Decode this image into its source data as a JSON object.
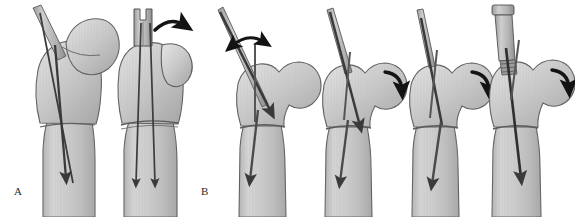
{
  "figure": {
    "kind": "surgical-technique-illustration",
    "background_color": "#ffffff",
    "width": 575,
    "height": 217,
    "palette": {
      "bone_fill": "#c6c6c6",
      "bone_fill_light": "#d8d8d8",
      "bone_fill_dark": "#a8a8a8",
      "bone_outline": "#5d5d5d",
      "instrument_fill": "#b4b4b4",
      "instrument_outline": "#555555",
      "arrow_dark": "#3a3a3a",
      "arrow_black": "#1a1a1a",
      "guidewire": "#454545",
      "label_color": "#2b2b2b"
    }
  },
  "panels": [
    {
      "id": "A",
      "label": "A",
      "label_x": 14,
      "label_y": 185,
      "caption_letter": "A",
      "figure_count": 2,
      "figures": [
        {
          "name": "panel-a-figure-1",
          "view": "anteroposterior",
          "description": "proximal femur with guide wire directed through femoral neck",
          "has_guidewire": true,
          "has_straight_arrow": true,
          "has_curved_arrow": false,
          "has_instrument": false
        },
        {
          "name": "panel-a-figure-2",
          "view": "lateral",
          "description": "proximal femur with slotted forked impactor and rotation arrow",
          "has_guidewire": true,
          "has_straight_arrow": true,
          "has_curved_arrow": true,
          "has_instrument": true,
          "instrument": "slotted-forked-impactor"
        }
      ]
    },
    {
      "id": "B",
      "label": "B",
      "label_x": 201,
      "label_y": 185,
      "caption_letter": "B",
      "figure_count": 4,
      "figures": [
        {
          "name": "panel-b-figure-1",
          "view": "anteroposterior",
          "description": "femur with oblique guide wire and double-headed rotation arrow at wire entry",
          "has_guidewire": true,
          "has_straight_arrow": true,
          "has_curved_arrow": true,
          "curved_arrow": "double-headed",
          "has_instrument": false
        },
        {
          "name": "panel-b-figure-2",
          "view": "anteroposterior",
          "description": "femur with guide wire and curved rotation arrow at femoral head",
          "has_guidewire": true,
          "has_straight_arrow": true,
          "has_curved_arrow": true,
          "curved_arrow": "single-headed",
          "has_instrument": true,
          "instrument": "guide-pin"
        },
        {
          "name": "panel-b-figure-3",
          "view": "anteroposterior",
          "description": "femur with converging guide wires and curved rotation arrow at femoral head",
          "has_guidewire": true,
          "has_straight_arrow": true,
          "has_curved_arrow": true,
          "curved_arrow": "single-headed",
          "has_instrument": true,
          "instrument": "guide-pin"
        },
        {
          "name": "panel-b-figure-4",
          "view": "anteroposterior",
          "description": "femur with cannulated threaded reamer inserted and curved rotation arrow",
          "has_guidewire": true,
          "has_straight_arrow": true,
          "has_curved_arrow": true,
          "curved_arrow": "single-headed",
          "has_instrument": true,
          "instrument": "cannulated-threaded-reamer"
        }
      ]
    }
  ]
}
